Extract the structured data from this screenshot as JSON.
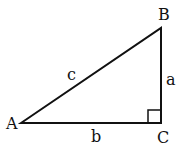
{
  "diagram": {
    "type": "right-triangle",
    "vertices": {
      "A": "A",
      "B": "B",
      "C": "C"
    },
    "sides": {
      "a": "a",
      "b": "b",
      "c": "c"
    },
    "right_angle_at": "C",
    "stroke_color": "#111111",
    "background": "#ffffff"
  }
}
